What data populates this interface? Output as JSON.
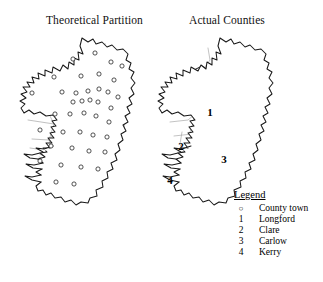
{
  "figure": {
    "background_color": "#ffffff",
    "ink_color": "#1a1a1a",
    "cell_color": "#8c8c8c"
  },
  "panels": {
    "left": {
      "title": "Theoretical Partition",
      "description": "Thiessen/Voronoi partition of Ireland around county towns"
    },
    "right": {
      "title": "Actual Counties",
      "description": "Actual county boundaries of Ireland"
    }
  },
  "county_labels": [
    {
      "number": "1",
      "name": "Longford",
      "x": 62,
      "y": 77
    },
    {
      "number": "2",
      "name": "Clare",
      "x": 33,
      "y": 111
    },
    {
      "number": "3",
      "name": "Carlow",
      "x": 76,
      "y": 124
    },
    {
      "number": "4",
      "name": "Kerry",
      "x": 22,
      "y": 145
    }
  ],
  "legend": {
    "title": "Legend",
    "entries": [
      {
        "key": "○",
        "label": "County town",
        "symbol": "circle-marker"
      },
      {
        "key": "1",
        "label": "Longford",
        "symbol": "number"
      },
      {
        "key": "2",
        "label": "Clare",
        "symbol": "number"
      },
      {
        "key": "3",
        "label": "Carlow",
        "symbol": "number"
      },
      {
        "key": "4",
        "label": "Kerry",
        "symbol": "number"
      }
    ]
  },
  "county_towns": [
    {
      "x": 63,
      "y": 23
    },
    {
      "x": 85,
      "y": 17
    },
    {
      "x": 101,
      "y": 26
    },
    {
      "x": 112,
      "y": 30
    },
    {
      "x": 44,
      "y": 41
    },
    {
      "x": 71,
      "y": 40
    },
    {
      "x": 89,
      "y": 38
    },
    {
      "x": 104,
      "y": 44
    },
    {
      "x": 22,
      "y": 57
    },
    {
      "x": 52,
      "y": 56
    },
    {
      "x": 66,
      "y": 57
    },
    {
      "x": 78,
      "y": 55
    },
    {
      "x": 89,
      "y": 53
    },
    {
      "x": 98,
      "y": 56
    },
    {
      "x": 108,
      "y": 61
    },
    {
      "x": 63,
      "y": 66
    },
    {
      "x": 72,
      "y": 65
    },
    {
      "x": 80,
      "y": 64
    },
    {
      "x": 88,
      "y": 66
    },
    {
      "x": 101,
      "y": 72
    },
    {
      "x": 45,
      "y": 78
    },
    {
      "x": 60,
      "y": 78
    },
    {
      "x": 74,
      "y": 77
    },
    {
      "x": 86,
      "y": 80
    },
    {
      "x": 99,
      "y": 86
    },
    {
      "x": 30,
      "y": 94
    },
    {
      "x": 53,
      "y": 96
    },
    {
      "x": 70,
      "y": 96
    },
    {
      "x": 83,
      "y": 99
    },
    {
      "x": 97,
      "y": 101
    },
    {
      "x": 41,
      "y": 110
    },
    {
      "x": 62,
      "y": 112
    },
    {
      "x": 79,
      "y": 115
    },
    {
      "x": 95,
      "y": 116
    },
    {
      "x": 30,
      "y": 125
    },
    {
      "x": 51,
      "y": 129
    },
    {
      "x": 71,
      "y": 131
    },
    {
      "x": 88,
      "y": 133
    },
    {
      "x": 46,
      "y": 146
    },
    {
      "x": 64,
      "y": 148
    }
  ]
}
